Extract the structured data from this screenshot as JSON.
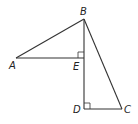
{
  "diagram": {
    "type": "geometry",
    "points": {
      "A": {
        "label": "A",
        "x": 16,
        "y": 58
      },
      "B": {
        "label": "B",
        "x": 84,
        "y": 19
      },
      "C": {
        "label": "C",
        "x": 122,
        "y": 109
      },
      "D": {
        "label": "D",
        "x": 84,
        "y": 109
      },
      "E": {
        "label": "E",
        "x": 84,
        "y": 58
      }
    },
    "segments": [
      "AB",
      "AE",
      "BD",
      "BC",
      "DC"
    ],
    "right_angles": [
      "BEA",
      "BDC"
    ]
  }
}
